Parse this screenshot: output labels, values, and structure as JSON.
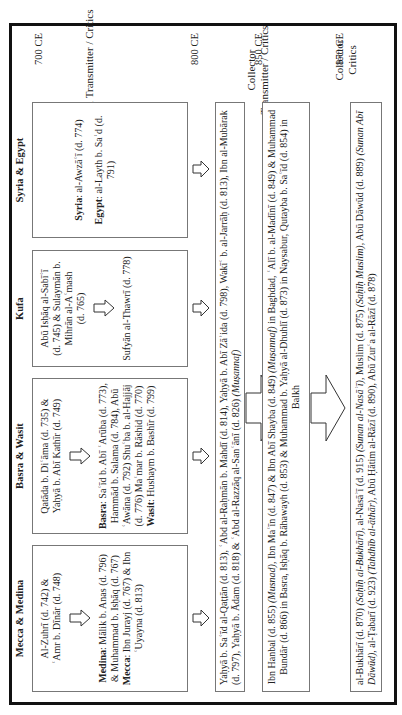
{
  "timeline": {
    "eras": [
      "700 CE",
      "800 CE",
      "850 CE",
      "870 CE"
    ]
  },
  "columns": {
    "regional": "Regional Transmitter / Critics",
    "collector_transmitter": [
      "Collector",
      "Transmitter / Critics"
    ],
    "collector_critics": [
      "Collector",
      "Critics"
    ]
  },
  "regions": [
    {
      "name": "Mecca & Medina",
      "early": [
        "Al-Zuhrī (d. 742) &",
        "ʿAmr b. Dīnār (d. 748)"
      ],
      "late": [
        {
          "label": "Medina",
          "text": ": Mālik b. Anas (d. 796) &  Muhammad b. Isḥāq (d. 767)"
        },
        {
          "label": "Mecca",
          "text": ": Ibn Jurayj (d. 767) & Ibn ʿUyayna (d. 813)"
        }
      ]
    },
    {
      "name": "Basra & Wasit",
      "early": [
        "Qatāda b. Diʿāma (d. 735) &",
        "Yaḥyā b. Abī Kathīr (d. 749)"
      ],
      "late": [
        {
          "label": "Basra",
          "text": ": Saʿīd b. Abī ʿArūba (d. 773), Hammād b. Salama (d. 784), Abū ʿAwāna (d. 792) Shuʿba b. al-Hajjāj (d. 776) Maʿmar b. Rāshid (d. 770) "
        },
        {
          "label": "Wasit",
          "text": ": Hushaym b. Bashīr (d. 799)"
        }
      ]
    },
    {
      "name": "Kufa",
      "early": [
        "Abū Isḥāq al-Sabīʿī",
        "(d. 745) & Sulaymān b.",
        "Mihrān al-Aʿmash",
        "(d. 765)"
      ],
      "late": [
        {
          "label": "",
          "text": "Sufyān al-Thawrī (d. 778)"
        }
      ]
    },
    {
      "name": "Syria & Egypt",
      "early": [],
      "late": [
        {
          "label": "Syria",
          "text": ": al-Awzāʿī (d. 774)"
        },
        {
          "label": "Egypt",
          "text": ": al-Layth b. Saʿd (d. 791)"
        }
      ]
    }
  ],
  "collector_transmitters_1": "Yaḥyā b. Saʿīd al-Qaṭṭān (d. 813), ʿAbd al-Raḥmān b. Mahdī (d. 814), Yaḥyā b. Abī Zāʾida (d. 798), Wakīʿ b. al-Jarrāḥ (d. 813), Ibn al-Mubārak (d. 797), Yaḥyā b. Ādam (d. 818) & ʿAbd al-Razzāq al-Sanʿānī (d. 826) ",
  "collector_transmitters_1_italic": "(Muṣannaf)",
  "collector_transmitters_2": {
    "a": "Ibn Hanbal (d. 855) ",
    "a_i": "(Musnad)",
    "b": ", Ibn Maʿīn (d. 847) & Ibn Abī Shayba (d. 849) ",
    "b_i": "(Muṣannaf)",
    "c": " in Baghdad, ʿAlī b. al-Madīnī (d. 849) & Muhammad Bundār (d. 866) in Basra, Isḥāq b. Rāhawayh (d. 853) & Muhammad b. Yaḥyā al-Dhuhlī (d. 873) in Naysabur, Qutayba b. Saʿīd (d. 854) in Balkh"
  },
  "collector_critics": {
    "a": "al-Bukhārī (d. 870) ",
    "a_i": "(Saḥīḥ al-Bukhārī)",
    "b": ", al-Nasāʾī (d. 915) ",
    "b_i": "(Sunan al-Nasāʾī)",
    "c": ", Muslim (d. 875) ",
    "c_i": "(Saḥīḥ Muslim)",
    "d": ", Abū Dāwūd (d. 889) ",
    "d_i": "(Sunan Abī Dāwūd)",
    "e": ", al-Ṭabarī (d. 923) ",
    "e_i": "(Tahdhīb al-āthār)",
    "f": ", Abū Ḥātim al-Rāzī (d. 890), Abū Zurʿa al-Rāzī (d. 878)"
  }
}
